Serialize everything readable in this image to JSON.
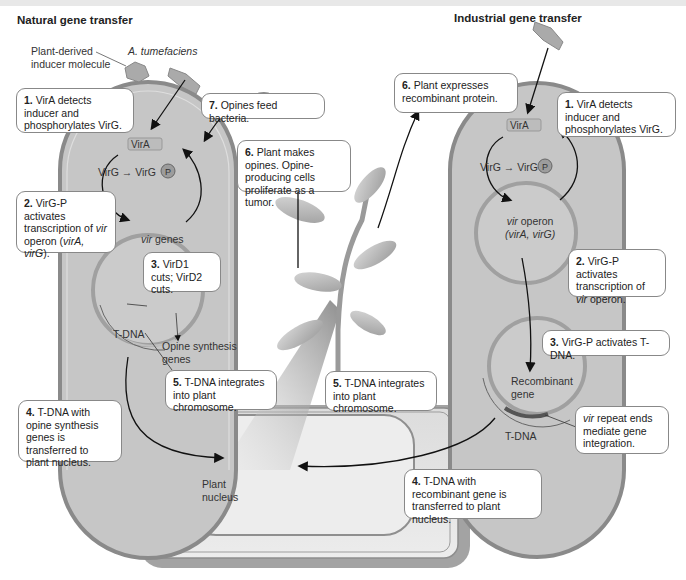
{
  "titles": {
    "natural": "Natural gene transfer",
    "industrial": "Industrial gene transfer"
  },
  "labels": {
    "inducer_line1": "Plant-derived",
    "inducer_line2": "inducer molecule",
    "organism": "A. tumefaciens",
    "vira_left": "VirA",
    "vira_right": "VirA",
    "virg_left": "VirG",
    "virgp_left": "VirG",
    "p_left": "P",
    "virg_right": "VirG",
    "virgp_right": "VirG",
    "p_right": "P",
    "vir_genes_italic": "vir",
    "vir_genes_rest": " genes",
    "tdna_left": "T-DNA",
    "opine_line1": "Opine synthesis",
    "opine_line2": "genes",
    "vir_operon_italic": "vir",
    "vir_operon_rest": " operon",
    "vir_operon_line2": "(virA, virG)",
    "recombinant_line1": "Recombinant",
    "recombinant_line2": "gene",
    "tdna_right": "T-DNA",
    "plant_nucleus_line1": "Plant",
    "plant_nucleus_line2": "nucleus"
  },
  "steps": {
    "n1": {
      "num": "1.",
      "text": " VirA detects inducer and phosphorylates VirG."
    },
    "n2": {
      "num": "2.",
      "pre": " VirG-P activates transcription of ",
      "it1": "vir",
      "mid": " operon (",
      "it2": "virA, virG",
      "post": ")."
    },
    "n3": {
      "num": "3.",
      "text": " VirD1 cuts; VirD2 cuts."
    },
    "n4": {
      "num": "4.",
      "text": " T-DNA with opine synthesis genes is transferred to plant nucleus."
    },
    "n5": {
      "num": "5.",
      "text": " T-DNA integrates into plant chromosome."
    },
    "n6": {
      "num": "6.",
      "text": " Plant makes opines. Opine-producing cells proliferate as a tumor."
    },
    "n7": {
      "num": "7.",
      "text": " Opines feed bacteria."
    },
    "i1": {
      "num": "1.",
      "text": " VirA detects inducer and phosphorylates VirG."
    },
    "i2": {
      "num": "2.",
      "pre": " VirG-P activates transcription of ",
      "it1": "vir",
      "post": " operon."
    },
    "i3": {
      "num": "3.",
      "text": " VirG-P activates T-DNA."
    },
    "i4": {
      "num": "4.",
      "text": " T-DNA with recombinant gene is transferred to plant nucleus."
    },
    "i5": {
      "num": "5.",
      "text": " T-DNA integrates into plant chromosome."
    },
    "i6": {
      "num": "6.",
      "text": " Plant expresses recombinant protein."
    },
    "irepeat": {
      "it1": "vir",
      "text": " repeat ends mediate gene integration."
    }
  },
  "colors": {
    "cell_fill": "#c9c9c9",
    "cell_wall": "#8a8a8a",
    "plasmid": "#a8a8a8",
    "plant_cell_outer": "#9a9a9a",
    "plant_cell_inner": "#e2e2e2",
    "phospho_badge": "#9c9c9c"
  }
}
